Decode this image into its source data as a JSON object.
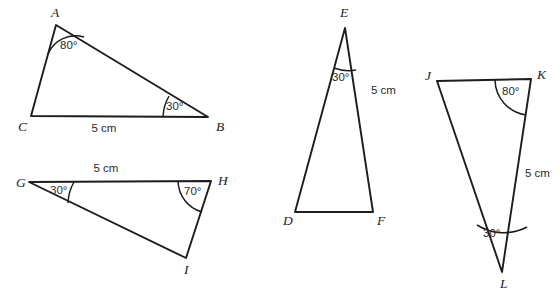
{
  "page": {
    "background_color": "#ffffff",
    "stroke_color": "#1d1d1d",
    "text_color": "#2a2a2a",
    "width": 558,
    "height": 295
  },
  "figures": [
    {
      "id": "triangle-abc",
      "vertices": [
        {
          "name": "A",
          "label": "A",
          "x": 56,
          "y": 25,
          "label_x": 51,
          "label_y": 17
        },
        {
          "name": "C",
          "label": "C",
          "x": 31,
          "y": 116,
          "label_x": 18,
          "label_y": 131
        },
        {
          "name": "B",
          "label": "B",
          "x": 208,
          "y": 117,
          "label_x": 216,
          "label_y": 131
        }
      ],
      "angles": [
        {
          "at": "A",
          "value": "80°",
          "label_x": 60,
          "label_y": 49
        },
        {
          "at": "B",
          "value": "30°",
          "label_x": 166,
          "label_y": 110
        }
      ],
      "sides": [
        {
          "between": "CB",
          "value": "5 cm",
          "label_x": 104,
          "label_y": 132
        }
      ]
    },
    {
      "id": "triangle-ghi",
      "vertices": [
        {
          "name": "G",
          "label": "G",
          "x": 29,
          "y": 182,
          "label_x": 16,
          "label_y": 187
        },
        {
          "name": "H",
          "label": "H",
          "x": 211,
          "y": 181,
          "label_x": 218,
          "label_y": 185
        },
        {
          "name": "I",
          "label": "I",
          "x": 186,
          "y": 258,
          "label_x": 184,
          "label_y": 274
        }
      ],
      "angles": [
        {
          "at": "G",
          "value": "30°",
          "label_x": 50,
          "label_y": 194
        },
        {
          "at": "H",
          "value": "70°",
          "label_x": 184,
          "label_y": 195
        }
      ],
      "sides": [
        {
          "between": "GH",
          "value": "5 cm",
          "label_x": 106,
          "label_y": 172
        }
      ]
    },
    {
      "id": "triangle-def",
      "vertices": [
        {
          "name": "E",
          "label": "E",
          "x": 345,
          "y": 28,
          "label_x": 340,
          "label_y": 17
        },
        {
          "name": "D",
          "label": "D",
          "x": 295,
          "y": 212,
          "label_x": 283,
          "label_y": 225
        },
        {
          "name": "F",
          "label": "F",
          "x": 373,
          "y": 212,
          "label_x": 377,
          "label_y": 225
        }
      ],
      "angles": [
        {
          "at": "E",
          "value": "30°",
          "label_x": 332,
          "label_y": 81
        }
      ],
      "sides": [
        {
          "between": "EF",
          "value": "5 cm",
          "label_x": 371,
          "label_y": 94
        }
      ]
    },
    {
      "id": "triangle-jkl",
      "vertices": [
        {
          "name": "J",
          "label": "J",
          "x": 437,
          "y": 81,
          "label_x": 425,
          "label_y": 80
        },
        {
          "name": "K",
          "label": "K",
          "x": 531,
          "y": 79,
          "label_x": 537,
          "label_y": 79
        },
        {
          "name": "L",
          "label": "L",
          "x": 502,
          "y": 272,
          "label_x": 500,
          "label_y": 288
        }
      ],
      "angles": [
        {
          "at": "K",
          "value": "80°",
          "label_x": 502,
          "label_y": 95
        },
        {
          "at": "L",
          "value": "30°",
          "label_x": 483,
          "label_y": 237
        }
      ],
      "sides": [
        {
          "between": "KL",
          "value": "5 cm",
          "label_x": 525,
          "label_y": 177
        }
      ]
    }
  ]
}
